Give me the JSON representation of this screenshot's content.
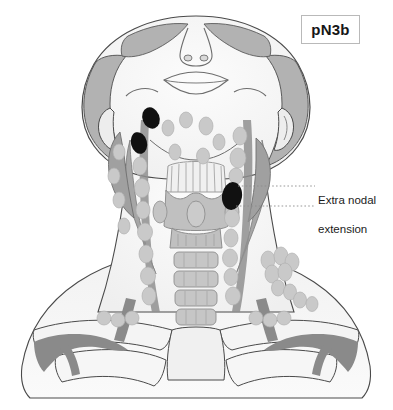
{
  "figure": {
    "stage_label": "pN3b",
    "callout_label": "Extra nodal\nextension",
    "callout_line1": "Extra nodal",
    "callout_line2": "extension"
  },
  "colors": {
    "skin_fill": "#f7f7f7",
    "skin_outline": "#4a4a4a",
    "hair_fill": "#b5b5b5",
    "muscle_fill": "#a8a8a8",
    "vessel_fill": "#8f8f8f",
    "cartilage_fill": "#c3c3c3",
    "node_normal": "#c9c9c9",
    "node_involved": "#111111",
    "leader_line": "#8c8c8c",
    "label_border": "#b9b9b9",
    "text": "#1b1b1b",
    "background": "#ffffff"
  },
  "anatomy": {
    "view": "anterior neck, head tilted back",
    "structures": [
      "head",
      "hair",
      "face",
      "nose",
      "mouth",
      "eyes",
      "ears",
      "mandible",
      "sternocleidomastoid",
      "parotid",
      "hyoid",
      "thyroid-cartilage",
      "thyroid-gland",
      "trachea",
      "clavicle",
      "subclavian-vessels",
      "jugular-vein",
      "lymph-node-chains"
    ]
  },
  "lymph_nodes": {
    "involved_count": 3,
    "involved": [
      {
        "cx": 151,
        "cy": 118,
        "rx": 8.5,
        "ry": 11,
        "rot": -20
      },
      {
        "cx": 139,
        "cy": 143,
        "rx": 8,
        "ry": 11,
        "rot": -15
      },
      {
        "cx": 232,
        "cy": 196,
        "rx": 10,
        "ry": 14,
        "rot": 8
      }
    ],
    "normal_right_chain": [
      {
        "cx": 240,
        "cy": 136,
        "rx": 7,
        "ry": 9
      },
      {
        "cx": 238,
        "cy": 158,
        "rx": 8,
        "ry": 10
      },
      {
        "cx": 236,
        "cy": 176,
        "rx": 7,
        "ry": 8
      },
      {
        "cx": 232,
        "cy": 218,
        "rx": 7.5,
        "ry": 9
      },
      {
        "cx": 231,
        "cy": 238,
        "rx": 7,
        "ry": 9
      },
      {
        "cx": 230,
        "cy": 258,
        "rx": 7.5,
        "ry": 9
      },
      {
        "cx": 231,
        "cy": 277,
        "rx": 7,
        "ry": 8.5
      },
      {
        "cx": 233,
        "cy": 296,
        "rx": 7.5,
        "ry": 9
      }
    ],
    "normal_left_chain": [
      {
        "cx": 140,
        "cy": 166,
        "rx": 7,
        "ry": 9
      },
      {
        "cx": 142,
        "cy": 188,
        "rx": 7.5,
        "ry": 9.5
      },
      {
        "cx": 143,
        "cy": 210,
        "rx": 7,
        "ry": 9
      },
      {
        "cx": 145,
        "cy": 232,
        "rx": 7.5,
        "ry": 9
      },
      {
        "cx": 146,
        "cy": 254,
        "rx": 7,
        "ry": 9
      },
      {
        "cx": 148,
        "cy": 276,
        "rx": 7.5,
        "ry": 9
      },
      {
        "cx": 149,
        "cy": 296,
        "rx": 7,
        "ry": 9
      }
    ],
    "normal_submandibular": [
      {
        "cx": 168,
        "cy": 128,
        "rx": 6,
        "ry": 8
      },
      {
        "cx": 186,
        "cy": 120,
        "rx": 6.5,
        "ry": 8
      },
      {
        "cx": 206,
        "cy": 126,
        "rx": 7,
        "ry": 9
      },
      {
        "cx": 219,
        "cy": 142,
        "rx": 6,
        "ry": 8
      },
      {
        "cx": 175,
        "cy": 152,
        "rx": 6,
        "ry": 8
      },
      {
        "cx": 203,
        "cy": 156,
        "rx": 6.5,
        "ry": 8
      }
    ],
    "normal_lateral_left": [
      {
        "cx": 119,
        "cy": 152,
        "rx": 6,
        "ry": 8
      },
      {
        "cx": 114,
        "cy": 176,
        "rx": 6,
        "ry": 8
      },
      {
        "cx": 119,
        "cy": 200,
        "rx": 6,
        "ry": 8
      },
      {
        "cx": 124,
        "cy": 226,
        "rx": 6,
        "ry": 8
      }
    ],
    "normal_supraclavicular": [
      {
        "cx": 268,
        "cy": 260,
        "rx": 7,
        "ry": 9
      },
      {
        "cx": 281,
        "cy": 256,
        "rx": 7,
        "ry": 9
      },
      {
        "cx": 292,
        "cy": 262,
        "rx": 7,
        "ry": 9
      },
      {
        "cx": 272,
        "cy": 274,
        "rx": 7,
        "ry": 9
      },
      {
        "cx": 285,
        "cy": 272,
        "rx": 7,
        "ry": 9
      },
      {
        "cx": 278,
        "cy": 288,
        "rx": 6.5,
        "ry": 8
      },
      {
        "cx": 290,
        "cy": 292,
        "rx": 6.5,
        "ry": 8
      },
      {
        "cx": 300,
        "cy": 300,
        "rx": 6.5,
        "ry": 8
      },
      {
        "cx": 312,
        "cy": 304,
        "rx": 6,
        "ry": 7.5
      },
      {
        "cx": 256,
        "cy": 318,
        "rx": 7,
        "ry": 7
      },
      {
        "cx": 270,
        "cy": 320,
        "rx": 7,
        "ry": 7
      },
      {
        "cx": 284,
        "cy": 318,
        "rx": 7,
        "ry": 7
      },
      {
        "cx": 104,
        "cy": 318,
        "rx": 7,
        "ry": 7
      },
      {
        "cx": 118,
        "cy": 320,
        "rx": 7,
        "ry": 7
      },
      {
        "cx": 132,
        "cy": 318,
        "rx": 7,
        "ry": 7
      }
    ]
  },
  "callout_lines": [
    {
      "y": 186,
      "x1": 238,
      "x2": 315
    },
    {
      "y": 206,
      "x1": 236,
      "x2": 315
    }
  ]
}
